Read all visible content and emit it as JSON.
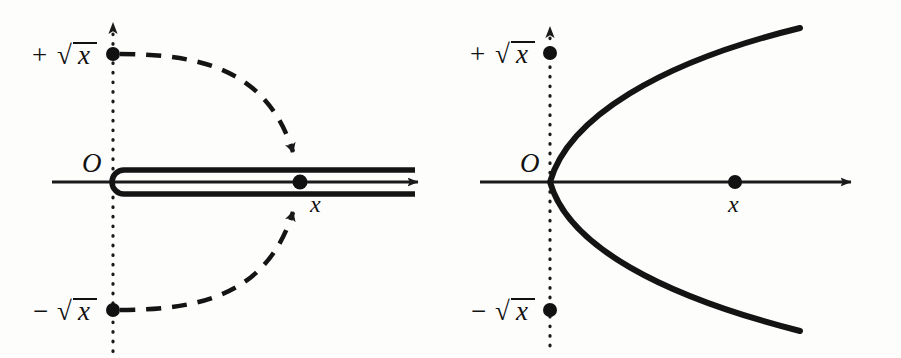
{
  "figure": {
    "background_color": "#fdfdfc",
    "ink_color": "#141414",
    "panels": [
      {
        "id": "left",
        "name": "hairpin-contour-panel",
        "description": "Real axis with a hairpin (dog-bone) contour wrapping the branch cut from the origin out past x, with dashed arcs from plus and minus root x arriving at the two sides of the cut",
        "origin_label": "O",
        "labels": {
          "positive_root": {
            "sign": "+",
            "radical": "√",
            "argument": "x"
          },
          "negative_root": {
            "sign": "−",
            "radical": "√",
            "argument": "x"
          },
          "point": "x"
        },
        "axes": {
          "real_axis": {
            "style": "solid",
            "arrow": "right",
            "y": 182,
            "x_start": 52,
            "x_end": 425
          },
          "imaginary_axis": {
            "style": "dotted",
            "arrow": "up",
            "x": 113,
            "y_top": 22,
            "y_bottom": 352
          }
        },
        "points": [
          {
            "name": "plus-sqrt-x-point",
            "x": 113,
            "y": 54
          },
          {
            "name": "minus-sqrt-x-point",
            "x": 113,
            "y": 310
          },
          {
            "name": "x-point",
            "x": 300,
            "y": 182
          }
        ],
        "contour": {
          "type": "hairpin",
          "turn_x": 113,
          "upper_rail_y": 170,
          "lower_rail_y": 194,
          "rail_end_x": 415
        },
        "dashed_arcs": [
          {
            "name": "upper-approach-arc",
            "from": [
              113,
              54
            ],
            "to": [
              298,
              168
            ],
            "arrow": "down"
          },
          {
            "name": "lower-approach-arc",
            "from": [
              113,
              310
            ],
            "to": [
              298,
              196
            ],
            "arrow": "up"
          }
        ]
      },
      {
        "id": "right",
        "name": "parabola-panel",
        "description": "Real axis with a rightward opening parabola whose vertex sits at the origin, the image of the square root map",
        "origin_label": "O",
        "labels": {
          "positive_root": {
            "sign": "+",
            "radical": "√",
            "argument": "x"
          },
          "negative_root": {
            "sign": "−",
            "radical": "√",
            "argument": "x"
          },
          "point": "x"
        },
        "axes": {
          "real_axis": {
            "style": "solid",
            "arrow": "right",
            "y": 182,
            "x_start": 480,
            "x_end": 858
          },
          "imaginary_axis": {
            "style": "dotted",
            "arrow": "up",
            "x": 550,
            "y_top": 26,
            "y_bottom": 352
          }
        },
        "points": [
          {
            "name": "plus-sqrt-x-point",
            "x": 550,
            "y": 53
          },
          {
            "name": "minus-sqrt-x-point",
            "x": 550,
            "y": 310
          },
          {
            "name": "x-point",
            "x": 735,
            "y": 182
          }
        ],
        "curve": {
          "type": "parabola",
          "opens": "right",
          "vertex": [
            550,
            182
          ],
          "upper_end": [
            800,
            28
          ],
          "lower_end": [
            800,
            331
          ]
        }
      }
    ]
  }
}
